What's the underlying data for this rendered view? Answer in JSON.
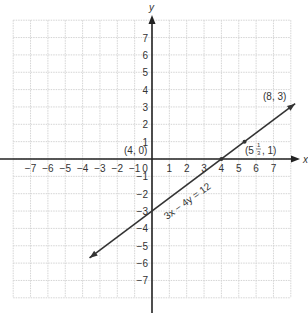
{
  "chart_data": {
    "type": "line",
    "title": "",
    "xlabel": "x",
    "ylabel": "y",
    "xlim": [
      -8,
      8
    ],
    "ylim": [
      -8,
      8
    ],
    "grid": true,
    "x_ticks": [
      "-7",
      "-6",
      "-5",
      "-4",
      "-3",
      "-2",
      "-1",
      "0",
      "1",
      "2",
      "3",
      "4",
      "5",
      "6",
      "7"
    ],
    "y_ticks": [
      "7",
      "6",
      "5",
      "4",
      "3",
      "2",
      "1",
      "-1",
      "-2",
      "-3",
      "-4",
      "-5",
      "-6",
      "-7"
    ],
    "series": [
      {
        "name": "3x − 4y = 12",
        "equation": "3x - 4y = 12",
        "x": [
          -3.5,
          0,
          4,
          5.333,
          8,
          8.4
        ],
        "values": [
          -5.625,
          -3,
          0,
          1,
          3,
          3.3
        ]
      }
    ],
    "annotations": [
      {
        "text": "(4, 0)",
        "x": 4,
        "y": 0
      },
      {
        "text": "(5 1/3, 1)",
        "x": 5.333,
        "y": 1
      },
      {
        "text": "(8, 3)",
        "x": 8,
        "y": 3
      },
      {
        "text": "3x − 4y = 12",
        "position": "along line"
      }
    ]
  },
  "labels": {
    "x_axis": "x",
    "y_axis": "y",
    "point1": "(4, 0)",
    "point2_whole": "(5",
    "point2_num": "1",
    "point2_den": "3",
    "point2_rest": ", 1)",
    "point3": "(8, 3)",
    "equation": "3x − 4y = 12"
  }
}
